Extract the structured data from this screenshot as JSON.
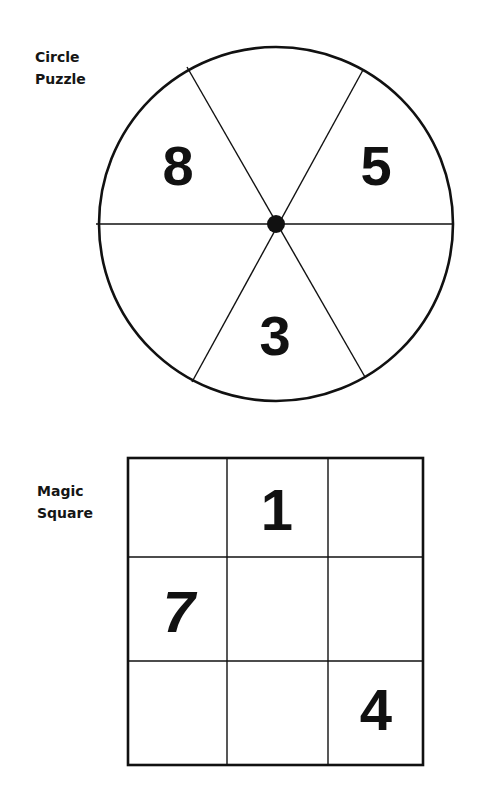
{
  "circle_puzzle": {
    "title_line1": "Circle",
    "title_line2": "Puzzle",
    "segments": [
      {
        "position": "top",
        "value": ""
      },
      {
        "position": "upper-right",
        "value": "5"
      },
      {
        "position": "lower-right",
        "value": ""
      },
      {
        "position": "bottom",
        "value": "3"
      },
      {
        "position": "lower-left",
        "value": ""
      },
      {
        "position": "upper-left",
        "value": "8"
      }
    ]
  },
  "magic_square": {
    "title_line1": "Magic",
    "title_line2": "Square",
    "cells": [
      [
        "",
        "1",
        ""
      ],
      [
        "7",
        "",
        ""
      ],
      [
        "",
        "",
        "4"
      ]
    ]
  },
  "colors": {
    "ink": "#111111",
    "background": "#ffffff"
  }
}
